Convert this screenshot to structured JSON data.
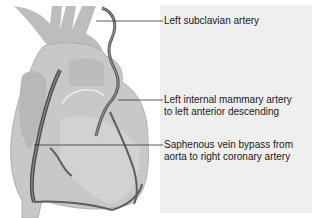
{
  "figure": {
    "panel_color": "#efefef",
    "heart_fill": "#c8c8c8",
    "heart_shade": "#b4b4b4",
    "vessel_color": "#5a5a5a",
    "leader_color": "#333333"
  },
  "labels": [
    {
      "id": "left-subclavian-artery",
      "lines": [
        "Left subclavian artery"
      ]
    },
    {
      "id": "lima-to-lad",
      "lines": [
        "Left internal mammary artery",
        "to left anterior descending"
      ]
    },
    {
      "id": "svg-to-rca",
      "lines": [
        "Saphenous vein bypass from",
        "aorta to right coronary artery"
      ]
    }
  ]
}
